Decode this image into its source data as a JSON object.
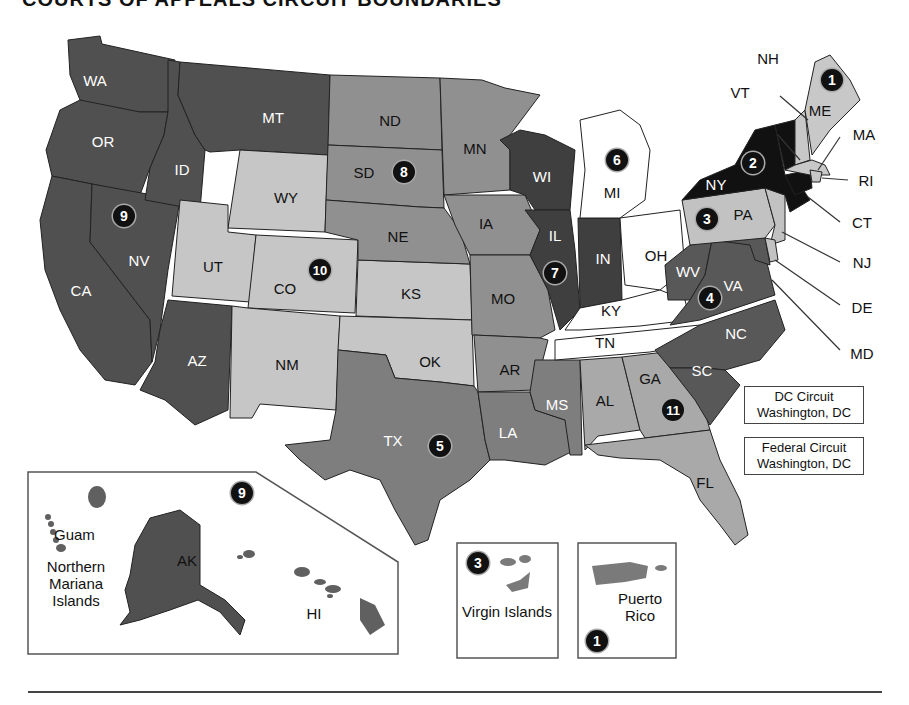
{
  "title": "COURTS OF APPEALS CIRCUIT BOUNDARIES",
  "colors": {
    "black": "#111111",
    "dark": "#4f4f4f",
    "darker": "#3d3d3d",
    "mid": "#8e8e8e",
    "light": "#c4c4c4",
    "white": "#ffffff"
  },
  "states": [
    {
      "abbr": "WA",
      "circuit": 9
    },
    {
      "abbr": "OR",
      "circuit": 9
    },
    {
      "abbr": "CA",
      "circuit": 9
    },
    {
      "abbr": "NV",
      "circuit": 9
    },
    {
      "abbr": "ID",
      "circuit": 9
    },
    {
      "abbr": "MT",
      "circuit": 9
    },
    {
      "abbr": "AZ",
      "circuit": 9
    },
    {
      "abbr": "AK",
      "circuit": 9
    },
    {
      "abbr": "HI",
      "circuit": 9
    },
    {
      "abbr": "WY",
      "circuit": 10
    },
    {
      "abbr": "UT",
      "circuit": 10
    },
    {
      "abbr": "CO",
      "circuit": 10
    },
    {
      "abbr": "NM",
      "circuit": 10
    },
    {
      "abbr": "KS",
      "circuit": 10
    },
    {
      "abbr": "OK",
      "circuit": 10
    },
    {
      "abbr": "ND",
      "circuit": 8
    },
    {
      "abbr": "SD",
      "circuit": 8
    },
    {
      "abbr": "NE",
      "circuit": 8
    },
    {
      "abbr": "MN",
      "circuit": 8
    },
    {
      "abbr": "IA",
      "circuit": 8
    },
    {
      "abbr": "MO",
      "circuit": 8
    },
    {
      "abbr": "AR",
      "circuit": 8
    },
    {
      "abbr": "TX",
      "circuit": 5
    },
    {
      "abbr": "LA",
      "circuit": 5
    },
    {
      "abbr": "MS",
      "circuit": 5
    },
    {
      "abbr": "WI",
      "circuit": 7
    },
    {
      "abbr": "IL",
      "circuit": 7
    },
    {
      "abbr": "IN",
      "circuit": 7
    },
    {
      "abbr": "MI",
      "circuit": 6
    },
    {
      "abbr": "OH",
      "circuit": 6
    },
    {
      "abbr": "KY",
      "circuit": 6
    },
    {
      "abbr": "TN",
      "circuit": 6
    },
    {
      "abbr": "AL",
      "circuit": 11
    },
    {
      "abbr": "GA",
      "circuit": 11
    },
    {
      "abbr": "FL",
      "circuit": 11
    },
    {
      "abbr": "WV",
      "circuit": 4
    },
    {
      "abbr": "VA",
      "circuit": 4
    },
    {
      "abbr": "NC",
      "circuit": 4
    },
    {
      "abbr": "SC",
      "circuit": 4
    },
    {
      "abbr": "MD",
      "circuit": 4
    },
    {
      "abbr": "PA",
      "circuit": 3
    },
    {
      "abbr": "NJ",
      "circuit": 3
    },
    {
      "abbr": "DE",
      "circuit": 3
    },
    {
      "abbr": "NY",
      "circuit": 2
    },
    {
      "abbr": "VT",
      "circuit": 2
    },
    {
      "abbr": "CT",
      "circuit": 2
    },
    {
      "abbr": "ME",
      "circuit": 1
    },
    {
      "abbr": "NH",
      "circuit": 1
    },
    {
      "abbr": "MA",
      "circuit": 1
    },
    {
      "abbr": "RI",
      "circuit": 1
    }
  ],
  "labels": {
    "WA": "WA",
    "OR": "OR",
    "CA": "CA",
    "NV": "NV",
    "ID": "ID",
    "MT": "MT",
    "AZ": "AZ",
    "WY": "WY",
    "UT": "UT",
    "CO": "CO",
    "NM": "NM",
    "ND": "ND",
    "SD": "SD",
    "NE": "NE",
    "KS": "KS",
    "OK": "OK",
    "TX": "TX",
    "MN": "MN",
    "IA": "IA",
    "MO": "MO",
    "AR": "AR",
    "LA": "LA",
    "WI": "WI",
    "IL": "IL",
    "IN": "IN",
    "MI": "MI",
    "OH": "OH",
    "KY": "KY",
    "TN": "TN",
    "MS": "MS",
    "AL": "AL",
    "GA": "GA",
    "FL": "FL",
    "SC": "SC",
    "NC": "NC",
    "VA": "VA",
    "WV": "WV",
    "PA": "PA",
    "NY": "NY",
    "VT": "VT",
    "NH": "NH",
    "ME": "ME",
    "MA": "MA",
    "RI": "RI",
    "CT": "CT",
    "NJ": "NJ",
    "DE": "DE",
    "MD": "MD",
    "AK": "AK",
    "HI": "HI"
  },
  "circuit_badges": [
    "1",
    "2",
    "3",
    "4",
    "5",
    "6",
    "7",
    "8",
    "9",
    "10",
    "11"
  ],
  "territories": {
    "guam": "Guam",
    "nmi": "Northern Mariana Islands",
    "vi": "Virgin Islands",
    "pr": "Puerto Rico"
  },
  "dc_circuit": {
    "name": "DC Circuit",
    "location": "Washington, DC"
  },
  "federal_circuit": {
    "name": "Federal Circuit",
    "location": "Washington, DC"
  }
}
